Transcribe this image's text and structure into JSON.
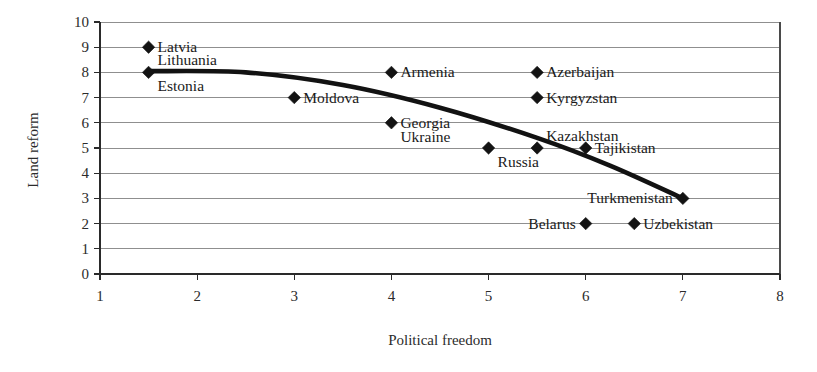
{
  "chart_data": {
    "type": "scatter",
    "title": "",
    "xlabel": "Political freedom",
    "ylabel": "Land reform",
    "xlim": [
      1,
      8
    ],
    "ylim": [
      0,
      10
    ],
    "xticks": [
      "1",
      "2",
      "3",
      "4",
      "5",
      "6",
      "7",
      "8"
    ],
    "yticks": [
      "0",
      "1",
      "2",
      "3",
      "4",
      "5",
      "6",
      "7",
      "8",
      "9",
      "10"
    ],
    "grid": "horizontal",
    "legend": "none",
    "marker_style": "filled-diamond",
    "points": [
      {
        "label": "Latvia",
        "x": 1.5,
        "y": 9,
        "label_side": "right"
      },
      {
        "label": "Lithuania",
        "x": 1.5,
        "y": 8,
        "label_side": "right-above"
      },
      {
        "label": "Estonia",
        "x": 1.5,
        "y": 8,
        "label_side": "right-below"
      },
      {
        "label": "Moldova",
        "x": 3.0,
        "y": 7,
        "label_side": "right"
      },
      {
        "label": "Armenia",
        "x": 4.0,
        "y": 8,
        "label_side": "right"
      },
      {
        "label": "Georgia",
        "x": 4.0,
        "y": 6,
        "label_side": "right"
      },
      {
        "label": "Ukraine",
        "x": 4.0,
        "y": 6,
        "label_side": "right-below"
      },
      {
        "label": "Azerbaijan",
        "x": 5.5,
        "y": 8,
        "label_side": "right"
      },
      {
        "label": "Kyrgyzstan",
        "x": 5.5,
        "y": 7,
        "label_side": "right"
      },
      {
        "label": "Kazakhstan",
        "x": 5.5,
        "y": 5,
        "label_side": "right-above"
      },
      {
        "label": "Russia",
        "x": 5.0,
        "y": 5,
        "label_side": "right-below"
      },
      {
        "label": "Tajikistan",
        "x": 6.0,
        "y": 5,
        "label_side": "right"
      },
      {
        "label": "Turkmenistan",
        "x": 7.0,
        "y": 3,
        "label_side": "left"
      },
      {
        "label": "Belarus",
        "x": 6.0,
        "y": 2,
        "label_side": "left"
      },
      {
        "label": "Uzbekistan",
        "x": 6.5,
        "y": 2,
        "label_side": "right"
      }
    ],
    "trend_line": {
      "description": "smooth downward curve fitted through the points",
      "knots": [
        {
          "x": 1.5,
          "y": 8.05
        },
        {
          "x": 2.5,
          "y": 8.0
        },
        {
          "x": 3.5,
          "y": 7.5
        },
        {
          "x": 4.5,
          "y": 6.6
        },
        {
          "x": 5.5,
          "y": 5.4
        },
        {
          "x": 6.25,
          "y": 4.3
        },
        {
          "x": 7.0,
          "y": 3.0
        }
      ]
    },
    "colors": {
      "marker": "#131313",
      "trend": "#121212",
      "grid": "#8f8f8f",
      "axis": "#2a2a2a",
      "text": "#1a1a1a",
      "background": "#ffffff"
    }
  }
}
